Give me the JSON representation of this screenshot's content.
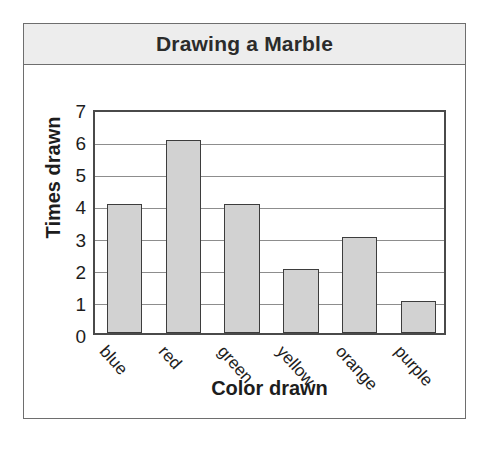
{
  "card": {
    "title": "Drawing a Marble"
  },
  "chart_data": {
    "type": "bar",
    "title": "Drawing a Marble",
    "xlabel": "Color drawn",
    "ylabel": "Times drawn",
    "categories": [
      "blue",
      "red",
      "green",
      "yellow",
      "orange",
      "purple"
    ],
    "values": [
      4,
      6,
      4,
      2,
      3,
      1
    ],
    "ylim": [
      0,
      7
    ],
    "ytick_labels": [
      "7",
      "6",
      "5",
      "4",
      "3",
      "2",
      "1",
      "0"
    ],
    "ytick_values": [
      7,
      6,
      5,
      4,
      3,
      2,
      1,
      0
    ],
    "grid": true,
    "legend": false,
    "bar_fill": "#d2d2d2",
    "bar_border": "#3d3d3d",
    "gridline_color": "#8d8d8d"
  }
}
